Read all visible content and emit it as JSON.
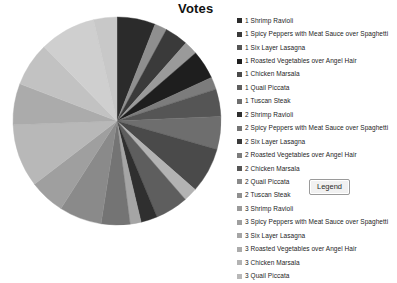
{
  "chart_data": {
    "type": "pie",
    "title": "Votes",
    "xlabel": "",
    "ylabel": "",
    "legend_position": "right",
    "grid": false,
    "categories": [
      "1 Shrimp Ravioli",
      "1 Spicy Peppers with Meat Sauce over Spaghetti",
      "1 Six Layer Lasagna",
      "1 Roasted Vegetables over Angel Hair",
      "1 Chicken Marsala",
      "1 Quail Piccata",
      "1 Tuscan Steak",
      "2 Shrimp Ravioli",
      "2 Spicy Peppers with Meat Sauce over Spaghetti",
      "2 Six Layer Lasagna",
      "2 Roasted Vegetables over Angel Hair",
      "2 Chicken Marsala",
      "2 Quail Piccata",
      "2 Tuscan Steak",
      "3 Shrimp Ravioli",
      "3 Spicy Peppers with Meat Sauce over Spaghetti",
      "3 Six Layer Lasagna",
      "3 Roasted Vegetables over Angel Hair",
      "3 Chicken Marsala",
      "3 Quail Piccata",
      "3 Tuscan Steak"
    ],
    "values": [
      28,
      9,
      17,
      10,
      21,
      9,
      20,
      24,
      33,
      10,
      24,
      12,
      8,
      21,
      31,
      26,
      46,
      30,
      32,
      41,
      17
    ],
    "colors": [
      "#2b2b2b",
      "#8f8f8f",
      "#3a3a3a",
      "#9a9a9a",
      "#1e1e1e",
      "#7c7c7c",
      "#555555",
      "#6e6e6e",
      "#4a4a4a",
      "#b3b3b3",
      "#5e5e5e",
      "#2f2f2f",
      "#a5a5a5",
      "#747474",
      "#8a8a8a",
      "#9f9f9f",
      "#b8b8b8",
      "#ababab",
      "#c2c2c2",
      "#cfcfcf",
      "#c8c8c8"
    ],
    "start_angle_deg": 0,
    "direction": "clockwise"
  },
  "legend": {
    "items": [
      {
        "label": "1 Shrimp Ravioli",
        "color": "#2b2b2b"
      },
      {
        "label": "1 Spicy Peppers with Meat Sauce over Spaghetti",
        "color": "#3a3a3a"
      },
      {
        "label": "1 Six Layer Lasagna",
        "color": "#555555"
      },
      {
        "label": "1 Roasted Vegetables over Angel Hair",
        "color": "#1e1e1e"
      },
      {
        "label": "1 Chicken Marsala",
        "color": "#4a4a4a"
      },
      {
        "label": "1 Quail Piccata",
        "color": "#5e5e5e"
      },
      {
        "label": "1 Tuscan Steak",
        "color": "#6e6e6e"
      },
      {
        "label": "2 Shrimp Ravioli",
        "color": "#2f2f2f"
      },
      {
        "label": "2 Spicy Peppers with Meat Sauce over Spaghetti",
        "color": "#747474"
      },
      {
        "label": "2 Six Layer Lasagna",
        "color": "#3a3a3a"
      },
      {
        "label": "2 Roasted Vegetables over Angel Hair",
        "color": "#7c7c7c"
      },
      {
        "label": "2 Chicken Marsala",
        "color": "#555555"
      },
      {
        "label": "2 Quail Piccata",
        "color": "#8a8a8a"
      },
      {
        "label": "2 Tuscan Steak",
        "color": "#8f8f8f"
      },
      {
        "label": "3 Shrimp Ravioli",
        "color": "#9a9a9a"
      },
      {
        "label": "3 Spicy Peppers with Meat Sauce over Spaghetti",
        "color": "#9f9f9f"
      },
      {
        "label": "3 Six Layer Lasagna",
        "color": "#a5a5a5"
      },
      {
        "label": "3 Roasted Vegetables over Angel Hair",
        "color": "#ababab"
      },
      {
        "label": "3 Chicken Marsala",
        "color": "#b3b3b3"
      },
      {
        "label": "3 Quail Piccata",
        "color": "#b8b8b8"
      },
      {
        "label": "3 Tuscan Steak",
        "color": "#c2c2c2"
      }
    ]
  },
  "tooltip": {
    "label": "Legend"
  }
}
